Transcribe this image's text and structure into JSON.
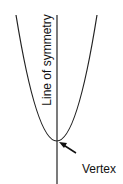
{
  "diagram": {
    "labels": {
      "axis": "Line of symmetry",
      "vertex": "Vertex"
    },
    "colors": {
      "stroke": "#222222",
      "background": "#ffffff"
    }
  }
}
